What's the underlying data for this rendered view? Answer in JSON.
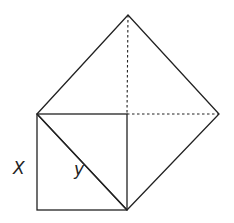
{
  "diagram": {
    "type": "geometry",
    "labels": {
      "side": "X",
      "diagonal": "y"
    },
    "colors": {
      "stroke": "#222222",
      "background": "#ffffff"
    },
    "points": {
      "small_square_top_left": [
        37,
        114
      ],
      "small_square_top_right": [
        127,
        114
      ],
      "small_square_bottom_right": [
        127,
        210
      ],
      "small_square_bottom_left": [
        37,
        210
      ],
      "big_square_top": [
        128,
        15
      ],
      "big_square_right": [
        219,
        114
      ]
    }
  }
}
